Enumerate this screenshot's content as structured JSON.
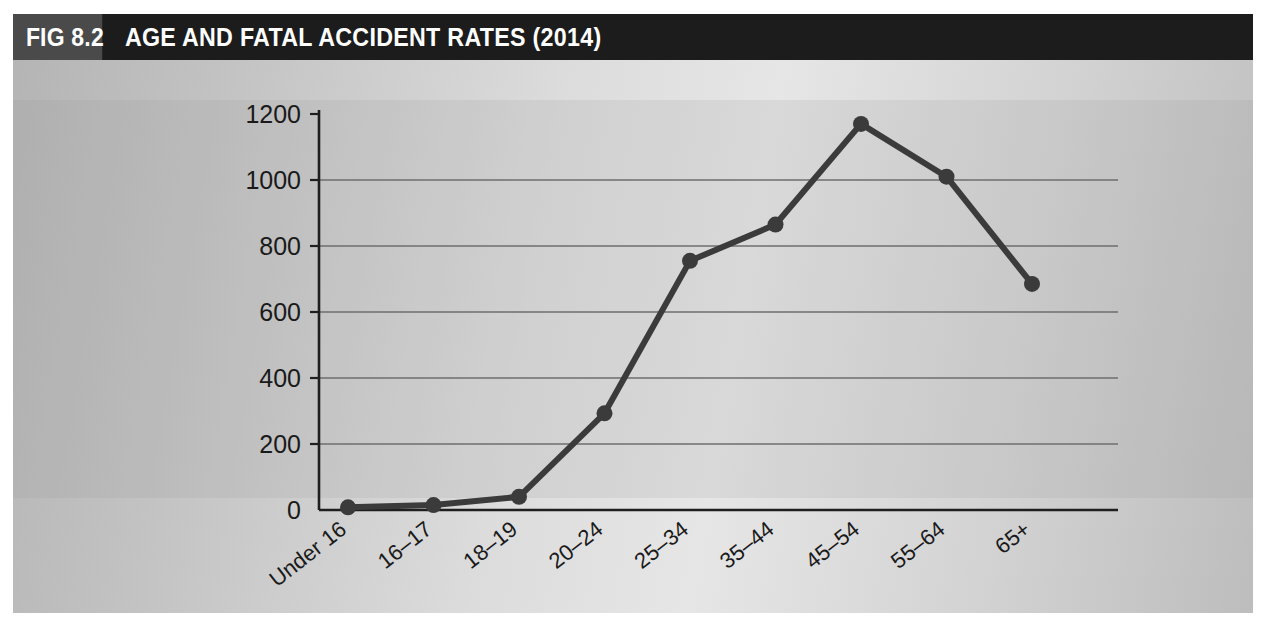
{
  "figure": {
    "tag": "FIG 8.2",
    "title": "AGE AND FATAL ACCIDENT RATES (2014)",
    "header_bg": "#1c1c1c",
    "tag_bg": "#4a4a4a",
    "series_color": "#3b3b3b"
  },
  "chart_data": {
    "type": "line",
    "title": "AGE AND FATAL ACCIDENT RATES (2014)",
    "xlabel": "",
    "ylabel": "",
    "grid": true,
    "legend": "none",
    "categories": [
      "Under 16",
      "16–17",
      "18–19",
      "20–24",
      "25–34",
      "35–44",
      "45–54",
      "55–64",
      "65+"
    ],
    "values": [
      8,
      15,
      40,
      293,
      755,
      865,
      1170,
      1010,
      685
    ],
    "ylim": [
      0,
      1200
    ],
    "yticks": [
      0,
      200,
      400,
      600,
      800,
      1000,
      1200
    ],
    "ytick_labels": [
      "0",
      "200",
      "400",
      "600",
      "800",
      "1000",
      "1200"
    ]
  }
}
